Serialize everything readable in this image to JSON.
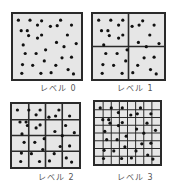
{
  "figure": {
    "panels": [
      {
        "label": "レベル 0",
        "level": 0,
        "divisions": 1,
        "box": {
          "x": 11,
          "y": 12,
          "w": 72,
          "h": 69
        },
        "label_pos": {
          "x": 40,
          "y": 82
        },
        "points": [
          [
            0.08,
            0.1
          ],
          [
            0.25,
            0.1
          ],
          [
            0.42,
            0.11
          ],
          [
            0.7,
            0.1
          ],
          [
            0.36,
            0.18
          ],
          [
            0.55,
            0.2
          ],
          [
            0.65,
            0.19
          ],
          [
            0.86,
            0.18
          ],
          [
            0.12,
            0.27
          ],
          [
            0.21,
            0.27
          ],
          [
            0.23,
            0.35
          ],
          [
            0.42,
            0.34
          ],
          [
            0.36,
            0.39
          ],
          [
            0.8,
            0.34
          ],
          [
            0.15,
            0.5
          ],
          [
            0.64,
            0.46
          ],
          [
            0.75,
            0.53
          ],
          [
            0.93,
            0.48
          ],
          [
            0.48,
            0.58
          ],
          [
            0.18,
            0.64
          ],
          [
            0.34,
            0.64
          ],
          [
            0.72,
            0.71
          ],
          [
            0.86,
            0.7
          ],
          [
            0.46,
            0.76
          ],
          [
            0.14,
            0.82
          ],
          [
            0.29,
            0.83
          ],
          [
            0.63,
            0.83
          ],
          [
            0.81,
            0.9
          ],
          [
            0.13,
            0.96
          ],
          [
            0.41,
            0.96
          ],
          [
            0.56,
            0.95
          ],
          [
            0.89,
            0.97
          ]
        ]
      },
      {
        "label": "レベル 1",
        "level": 1,
        "divisions": 2,
        "box": {
          "x": 91,
          "y": 12,
          "w": 75,
          "h": 69
        },
        "label_pos": {
          "x": 117,
          "y": 82
        },
        "points": [
          [
            0.08,
            0.1
          ],
          [
            0.25,
            0.1
          ],
          [
            0.42,
            0.1
          ],
          [
            0.7,
            0.11
          ],
          [
            0.36,
            0.18
          ],
          [
            0.55,
            0.2
          ],
          [
            0.65,
            0.18
          ],
          [
            0.86,
            0.18
          ],
          [
            0.12,
            0.27
          ],
          [
            0.21,
            0.27
          ],
          [
            0.23,
            0.35
          ],
          [
            0.42,
            0.34
          ],
          [
            0.36,
            0.39
          ],
          [
            0.8,
            0.34
          ],
          [
            0.15,
            0.5
          ],
          [
            0.64,
            0.46
          ],
          [
            0.75,
            0.53
          ],
          [
            0.93,
            0.48
          ],
          [
            0.48,
            0.58
          ],
          [
            0.18,
            0.64
          ],
          [
            0.34,
            0.64
          ],
          [
            0.72,
            0.71
          ],
          [
            0.86,
            0.7
          ],
          [
            0.46,
            0.76
          ],
          [
            0.14,
            0.82
          ],
          [
            0.29,
            0.83
          ],
          [
            0.63,
            0.83
          ],
          [
            0.81,
            0.9
          ],
          [
            0.13,
            0.96
          ],
          [
            0.41,
            0.96
          ],
          [
            0.56,
            0.95
          ],
          [
            0.89,
            0.97
          ]
        ]
      },
      {
        "label": "レベル 2",
        "level": 2,
        "divisions": 4,
        "box": {
          "x": 10,
          "y": 102,
          "w": 71,
          "h": 67
        },
        "label_pos": {
          "x": 38,
          "y": 171
        },
        "points": [
          [
            0.08,
            0.1
          ],
          [
            0.25,
            0.1
          ],
          [
            0.42,
            0.1
          ],
          [
            0.7,
            0.1
          ],
          [
            0.36,
            0.18
          ],
          [
            0.55,
            0.22
          ],
          [
            0.65,
            0.2
          ],
          [
            0.86,
            0.2
          ],
          [
            0.12,
            0.3
          ],
          [
            0.21,
            0.3
          ],
          [
            0.23,
            0.36
          ],
          [
            0.42,
            0.35
          ],
          [
            0.36,
            0.4
          ],
          [
            0.8,
            0.36
          ],
          [
            0.15,
            0.5
          ],
          [
            0.64,
            0.46
          ],
          [
            0.75,
            0.53
          ],
          [
            0.93,
            0.48
          ],
          [
            0.48,
            0.58
          ],
          [
            0.18,
            0.64
          ],
          [
            0.34,
            0.64
          ],
          [
            0.72,
            0.71
          ],
          [
            0.86,
            0.7
          ],
          [
            0.46,
            0.76
          ],
          [
            0.14,
            0.82
          ],
          [
            0.29,
            0.83
          ],
          [
            0.63,
            0.83
          ],
          [
            0.81,
            0.9
          ],
          [
            0.13,
            0.96
          ],
          [
            0.41,
            0.96
          ],
          [
            0.56,
            0.95
          ],
          [
            0.89,
            0.97
          ]
        ]
      },
      {
        "label": "レベル 3",
        "level": 3,
        "divisions": 8,
        "box": {
          "x": 93,
          "y": 100,
          "w": 69,
          "h": 66
        },
        "label_pos": {
          "x": 117,
          "y": 171
        },
        "points": [
          [
            0.08,
            0.1
          ],
          [
            0.25,
            0.1
          ],
          [
            0.42,
            0.1
          ],
          [
            0.7,
            0.1
          ],
          [
            0.36,
            0.18
          ],
          [
            0.55,
            0.22
          ],
          [
            0.65,
            0.2
          ],
          [
            0.86,
            0.2
          ],
          [
            0.12,
            0.3
          ],
          [
            0.21,
            0.3
          ],
          [
            0.23,
            0.36
          ],
          [
            0.42,
            0.35
          ],
          [
            0.36,
            0.4
          ],
          [
            0.8,
            0.36
          ],
          [
            0.15,
            0.5
          ],
          [
            0.64,
            0.46
          ],
          [
            0.75,
            0.53
          ],
          [
            0.93,
            0.48
          ],
          [
            0.48,
            0.58
          ],
          [
            0.18,
            0.64
          ],
          [
            0.34,
            0.64
          ],
          [
            0.72,
            0.71
          ],
          [
            0.86,
            0.7
          ],
          [
            0.46,
            0.76
          ],
          [
            0.14,
            0.82
          ],
          [
            0.29,
            0.83
          ],
          [
            0.63,
            0.83
          ],
          [
            0.81,
            0.9
          ],
          [
            0.13,
            0.96
          ],
          [
            0.41,
            0.96
          ],
          [
            0.56,
            0.95
          ],
          [
            0.89,
            0.97
          ]
        ]
      }
    ],
    "colors": {
      "fill": "#e6e6e6",
      "border": "#2a2a2a",
      "point": "#111111",
      "label": "#555555"
    }
  }
}
